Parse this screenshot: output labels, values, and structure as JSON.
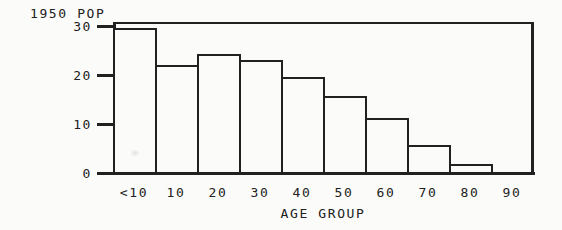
{
  "window": {
    "background_color": "#fbfbf9",
    "ink_color": "#212121"
  },
  "chart_data": {
    "type": "bar",
    "title": "1950 POP",
    "xlabel": "AGE GROUP",
    "ylabel": "",
    "categories": [
      "<10",
      "10",
      "20",
      "30",
      "40",
      "50",
      "60",
      "70",
      "80",
      "90"
    ],
    "values": [
      29.4,
      21.8,
      24.1,
      22.9,
      19.4,
      15.6,
      11.0,
      5.6,
      1.7,
      0
    ],
    "y_ticks": [
      30,
      20,
      10,
      0
    ],
    "ylim": [
      0,
      31
    ],
    "xlim_note": "bars are contiguous decade bins drawn flush against the y-axis; the 90 bin shows no visible bar",
    "grid": false,
    "legend": "none",
    "bar_fill": "#fbfbf9",
    "bar_border": "#212121"
  }
}
